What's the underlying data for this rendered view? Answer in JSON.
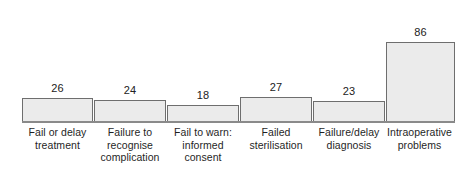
{
  "chart_data": {
    "type": "bar",
    "title": "",
    "subtitle": "",
    "xlabel": "",
    "ylabel": "",
    "ylim": [
      0,
      100
    ],
    "grid": false,
    "legend": null,
    "axis": {
      "baseline_only": true,
      "tick_labels": [],
      "y_axis_visible": false
    },
    "categories": [
      "Fail or delay treatment",
      "Failure to recognise complication",
      "Fail to warn: informed consent",
      "Failed sterilisation",
      "Failure/delay diagnosis",
      "Intraoperative problems"
    ],
    "category_lines": [
      [
        "Fail or delay",
        "treatment"
      ],
      [
        "Failure to",
        "recognise",
        "complication"
      ],
      [
        "Fail to warn:",
        "informed",
        "consent"
      ],
      [
        "Failed",
        "sterilisation"
      ],
      [
        "Failure/delay",
        "diagnosis"
      ],
      [
        "Intraoperative",
        "problems"
      ]
    ],
    "values": [
      26,
      24,
      18,
      27,
      23,
      86
    ],
    "value_labels": [
      "26",
      "24",
      "18",
      "27",
      "23",
      "86"
    ],
    "colors": {
      "bar_fill": "#ebebeb",
      "bar_border": "#6e6e6e",
      "axis_line": "#8a8a8a",
      "label_text": "#1f1f1f",
      "value_text": "#222222",
      "background": "#ffffff"
    }
  }
}
